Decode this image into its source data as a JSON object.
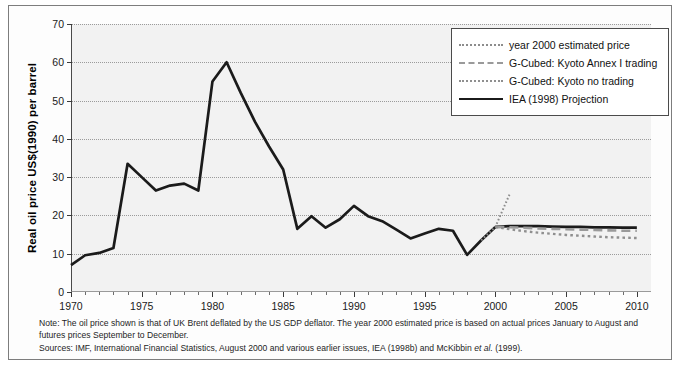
{
  "figure": {
    "background": "#ffffff",
    "plot_background": "#f2f2f2",
    "frame_color": "#7d7d7d"
  },
  "axes": {
    "y_title": "Real oil price US$(1990) per barrel",
    "y_ticks": [
      0,
      10,
      20,
      30,
      40,
      50,
      60,
      70
    ],
    "x_ticks": [
      1970,
      1975,
      1980,
      1985,
      1990,
      1995,
      2000,
      2005,
      2010
    ],
    "x_minor_step": 1,
    "ylim": [
      0,
      70
    ],
    "xlim": [
      1970,
      2011
    ]
  },
  "legend": {
    "position": "top-right",
    "items": [
      {
        "label": "year 2000 estimated price",
        "style": "fine-dotted",
        "color": "#8c8c8c"
      },
      {
        "label": "G-Cubed: Kyoto Annex I trading",
        "style": "dashed",
        "color": "#9a9a9a"
      },
      {
        "label": "G-Cubed: Kyoto no trading",
        "style": "dotted",
        "color": "#8f8f8f"
      },
      {
        "label": "IEA (1998) Projection",
        "style": "solid",
        "color": "#1b1b1b"
      }
    ]
  },
  "notes": {
    "note": "Note: The oil price shown is that of UK Brent deflated by the US GDP deflator. The year 2000 estimated price is based on actual prices January to August and futures prices September to December.",
    "sources_prefix": "Sources: IMF, International Financial Statistics, August 2000 and various earlier issues, IEA (1998b) and McKibbin ",
    "sources_italic": "et al.",
    "sources_suffix": " (1999)."
  },
  "chart_data": {
    "type": "line",
    "title": "",
    "xlabel": "",
    "ylabel": "Real oil price US$(1990) per barrel",
    "xlim": [
      1970,
      2011
    ],
    "ylim": [
      0,
      70
    ],
    "grid": "horizontal-dotted",
    "legend_position": "top-right",
    "series": [
      {
        "name": "Historical real oil price (UK Brent, deflated)",
        "style": "solid",
        "color": "#1b1b1b",
        "x": [
          1970,
          1971,
          1972,
          1973,
          1974,
          1975,
          1976,
          1977,
          1978,
          1979,
          1980,
          1981,
          1982,
          1983,
          1984,
          1985,
          1986,
          1987,
          1988,
          1989,
          1990,
          1991,
          1992,
          1993,
          1994,
          1995,
          1996,
          1997,
          1998,
          1999,
          2000
        ],
        "y": [
          7.0,
          9.6,
          10.2,
          11.5,
          33.5,
          30.0,
          26.5,
          27.8,
          28.3,
          26.5,
          55.0,
          60.0,
          52.0,
          44.5,
          38.0,
          32.0,
          16.5,
          19.8,
          16.8,
          19.0,
          22.5,
          19.8,
          18.5,
          16.3,
          14.0,
          15.3,
          16.5,
          16.0,
          9.7,
          13.5,
          17.0
        ]
      },
      {
        "name": "year 2000 estimated price",
        "style": "fine-dotted",
        "color": "#8c8c8c",
        "x": [
          1999.0,
          2000.0,
          2001.0
        ],
        "y": [
          13.5,
          17.0,
          25.5
        ]
      },
      {
        "name": "IEA (1998) Projection",
        "style": "solid",
        "color": "#1b1b1b",
        "x": [
          2000,
          2001,
          2002,
          2003,
          2004,
          2005,
          2006,
          2007,
          2008,
          2009,
          2010
        ],
        "y": [
          17.0,
          17.2,
          17.2,
          17.2,
          17.1,
          17.0,
          17.0,
          16.9,
          16.9,
          16.8,
          16.8
        ]
      },
      {
        "name": "G-Cubed: Kyoto Annex I trading",
        "style": "dashed",
        "color": "#9a9a9a",
        "x": [
          2000,
          2001,
          2002,
          2003,
          2004,
          2005,
          2006,
          2007,
          2008,
          2009,
          2010
        ],
        "y": [
          17.0,
          16.9,
          16.8,
          16.6,
          16.5,
          16.4,
          16.3,
          16.2,
          16.1,
          16.0,
          16.0
        ]
      },
      {
        "name": "G-Cubed: Kyoto no trading",
        "style": "dotted",
        "color": "#8f8f8f",
        "x": [
          2000,
          2001,
          2002,
          2003,
          2004,
          2005,
          2006,
          2007,
          2008,
          2009,
          2010
        ],
        "y": [
          17.0,
          16.4,
          15.9,
          15.5,
          15.2,
          14.9,
          14.7,
          14.5,
          14.3,
          14.2,
          14.1
        ]
      }
    ]
  }
}
